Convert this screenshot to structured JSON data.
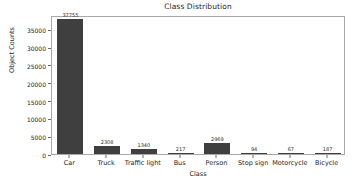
{
  "chart_data": {
    "type": "bar",
    "title": "Class Distribution",
    "xlabel": "Class",
    "ylabel": "Object Counts",
    "categories": [
      "Car",
      "Truck",
      "Traffic light",
      "Bus",
      "Person",
      "Stop sign",
      "Motorcycle",
      "Bicycle"
    ],
    "values": [
      37755,
      2308,
      1340,
      217,
      2969,
      94,
      67,
      187
    ],
    "value_labels": [
      "37755",
      "2308",
      "1340",
      "217",
      "2969",
      "94",
      "67",
      "187"
    ],
    "ylim": [
      0,
      39000
    ],
    "ytick_labels": [
      "0",
      "5000",
      "10000",
      "15000",
      "20000",
      "25000",
      "30000",
      "35000"
    ],
    "ytick_values": [
      0,
      5000,
      10000,
      15000,
      20000,
      25000,
      30000,
      35000
    ],
    "grid": false,
    "legend": false,
    "bar_color": "#3f3f3f",
    "background_color": "#ffffff",
    "axis_color": "#a8a8a8"
  }
}
